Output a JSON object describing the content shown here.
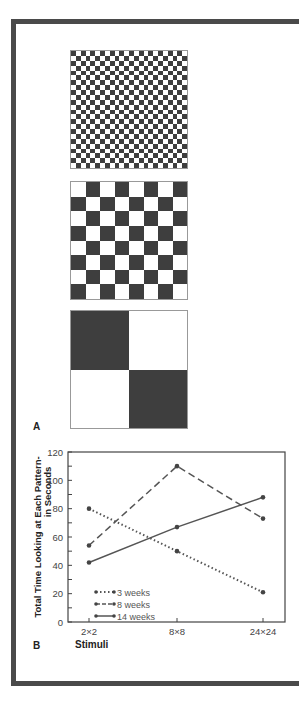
{
  "figure": {
    "panel_a_label": "A",
    "panel_b_label": "B",
    "stimuli": [
      {
        "name": "24x24 checkerboard",
        "n": 24,
        "top": 50
      },
      {
        "name": "8x8 checkerboard",
        "n": 8,
        "top": 181
      },
      {
        "name": "2x2 checkerboard",
        "n": 2,
        "top": 310
      }
    ]
  },
  "chart_data": {
    "type": "line",
    "title": "",
    "xlabel": "Stimuli",
    "ylabel": "Total Time Looking at Each Pattern-in Seconds",
    "ylabel_lines": [
      "Total Time Looking at Each Pattern-",
      "in Seconds"
    ],
    "categories": [
      "2×2",
      "8×8",
      "24×24"
    ],
    "ylim": [
      0,
      120
    ],
    "yticks": [
      0,
      20,
      40,
      60,
      80,
      100,
      120
    ],
    "grid": false,
    "legend_position": "lower left inside",
    "series": [
      {
        "name": "3 weeks",
        "style": "dotted",
        "values": [
          80,
          50,
          21
        ]
      },
      {
        "name": "8 weeks",
        "style": "dashed",
        "values": [
          54,
          110,
          73
        ]
      },
      {
        "name": "14 weeks",
        "style": "solid",
        "values": [
          42,
          67,
          88
        ]
      }
    ]
  },
  "colors": {
    "ink": "#3e3e3e",
    "frame": "#4a4a4a"
  }
}
